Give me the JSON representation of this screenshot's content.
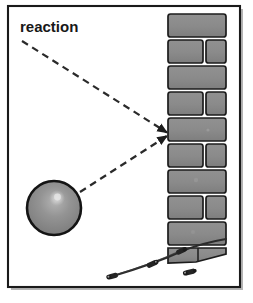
{
  "figure": {
    "name": "reaction-force-diagram",
    "width": 253,
    "height": 303,
    "background_color": "#ffffff"
  },
  "frame": {
    "name": "figure-border",
    "x": 8,
    "y": 6,
    "width": 232,
    "height": 281,
    "stroke_color": "#1a1a1a",
    "shadow_color": "#6e6e6e"
  },
  "labels": [
    {
      "id": "reaction",
      "text": "reaction",
      "x": 20,
      "y": 19,
      "bold": true,
      "font_size": 15,
      "color": "#181818"
    }
  ],
  "leader_lines": [
    {
      "id": "leader-from-label",
      "from_x": 22,
      "from_y": 41,
      "to_x": 168,
      "to_y": 133,
      "style": "dashed",
      "dash": "7,5",
      "color": "#2a2a2a",
      "width": 2.2,
      "arrow": true
    },
    {
      "id": "leader-from-ball",
      "from_x": 79,
      "from_y": 192,
      "to_x": 168,
      "to_y": 136,
      "style": "dashed",
      "dash": "7,5",
      "color": "#2a2a2a",
      "width": 2.2,
      "arrow": true
    }
  ],
  "ball": {
    "name": "ball",
    "center_x": 54,
    "center_y": 208,
    "radius_x": 27,
    "radius_y": 27,
    "fill_color": "#8f8f8f",
    "outline_color": "#141414",
    "outline_width": 2.6,
    "highlight_color": "#d2d2d2",
    "highlight_x": 57,
    "highlight_y": 198,
    "highlight_r": 7
  },
  "wall": {
    "name": "brick-wall",
    "x": 167,
    "y": 13,
    "width": 60,
    "height": 243,
    "brick_fill": "#8a8a8a",
    "brick_fill_alt": "#848484",
    "brick_stroke": "#1c1c1c",
    "mortar_color": "#ffffff",
    "row_height": 26,
    "split_ratio": 0.62,
    "rows": [
      {
        "index": 0,
        "type": "full"
      },
      {
        "index": 1,
        "type": "split"
      },
      {
        "index": 2,
        "type": "full"
      },
      {
        "index": 3,
        "type": "split"
      },
      {
        "index": 4,
        "type": "full"
      },
      {
        "index": 5,
        "type": "split"
      },
      {
        "index": 6,
        "type": "full"
      },
      {
        "index": 7,
        "type": "split"
      },
      {
        "index": 8,
        "type": "full"
      },
      {
        "index": 9,
        "type": "full"
      }
    ]
  },
  "cable": {
    "name": "cable",
    "color": "#2b2b2b",
    "width": 2.2,
    "path": "M 113 276 C 140 268 158 262 180 252 C 196 245 208 242 224 240",
    "connectors": [
      {
        "id": "connector-left",
        "x": 115,
        "y": 276,
        "w": 10,
        "h": 5,
        "angle": -14
      },
      {
        "id": "connector-mid",
        "x": 152,
        "y": 264,
        "w": 11,
        "h": 5,
        "angle": -22
      },
      {
        "id": "connector-right",
        "x": 180,
        "y": 252,
        "w": 10,
        "h": 5,
        "angle": -22
      },
      {
        "id": "connector-loose",
        "x": 190,
        "y": 272,
        "w": 11,
        "h": 5,
        "angle": -14
      }
    ]
  }
}
